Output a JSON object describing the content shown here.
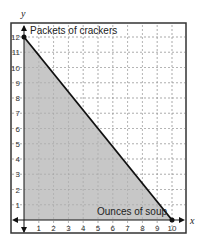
{
  "chart_data": {
    "type": "area",
    "title": "",
    "xlabel": "x",
    "ylabel": "y",
    "xlim": [
      0,
      10
    ],
    "ylim": [
      0,
      12
    ],
    "xticks": [
      1,
      2,
      3,
      4,
      5,
      6,
      7,
      8,
      9,
      10
    ],
    "yticks": [
      1,
      2,
      3,
      4,
      5,
      6,
      7,
      8,
      9,
      10,
      11,
      12
    ],
    "grid": true,
    "annotations": [
      {
        "text": "Packets of crackers",
        "position": "top-left near y-axis"
      },
      {
        "text": "Ounces of soup",
        "position": "bottom-right near x-axis"
      }
    ],
    "series": [
      {
        "name": "boundary line",
        "points": [
          [
            0,
            12
          ],
          [
            10,
            0
          ]
        ],
        "style": "solid"
      }
    ],
    "points": [
      [
        0,
        12
      ],
      [
        10,
        0
      ]
    ],
    "shaded_region": "below line, x>=0, y>=0",
    "colors": {
      "shade": "#bdbdbd",
      "line": "#111111",
      "grid": "#999999"
    }
  },
  "labels": {
    "x_axis": "x",
    "y_axis": "y",
    "y_annotation": "Packets of crackers",
    "x_annotation": "Ounces of soup"
  }
}
